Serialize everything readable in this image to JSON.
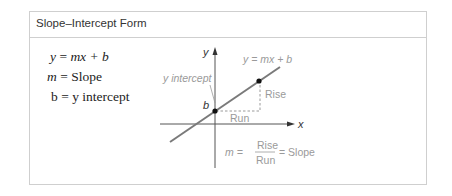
{
  "title": "Slope–Intercept Form",
  "equations": [
    {
      "lhs": "y",
      "rhs": "mx + b"
    },
    {
      "lhs": "m",
      "rhs": "Slope"
    },
    {
      "lhs": "b",
      "rhs": "y intercept"
    }
  ],
  "diagram": {
    "axis_x_label": "x",
    "axis_y_label": "y",
    "line_label": "y = mx + b",
    "y_intercept_label": "y intercept",
    "b_label": "b",
    "rise_label": "Rise",
    "run_label": "Run",
    "formula": {
      "lhs": "m =",
      "numerator": "Rise",
      "denominator": "Run",
      "rhs": "= Slope"
    }
  },
  "colors": {
    "line": "#7a7a7a",
    "label": "#9a9a9a",
    "border": "#cfcfcf"
  }
}
